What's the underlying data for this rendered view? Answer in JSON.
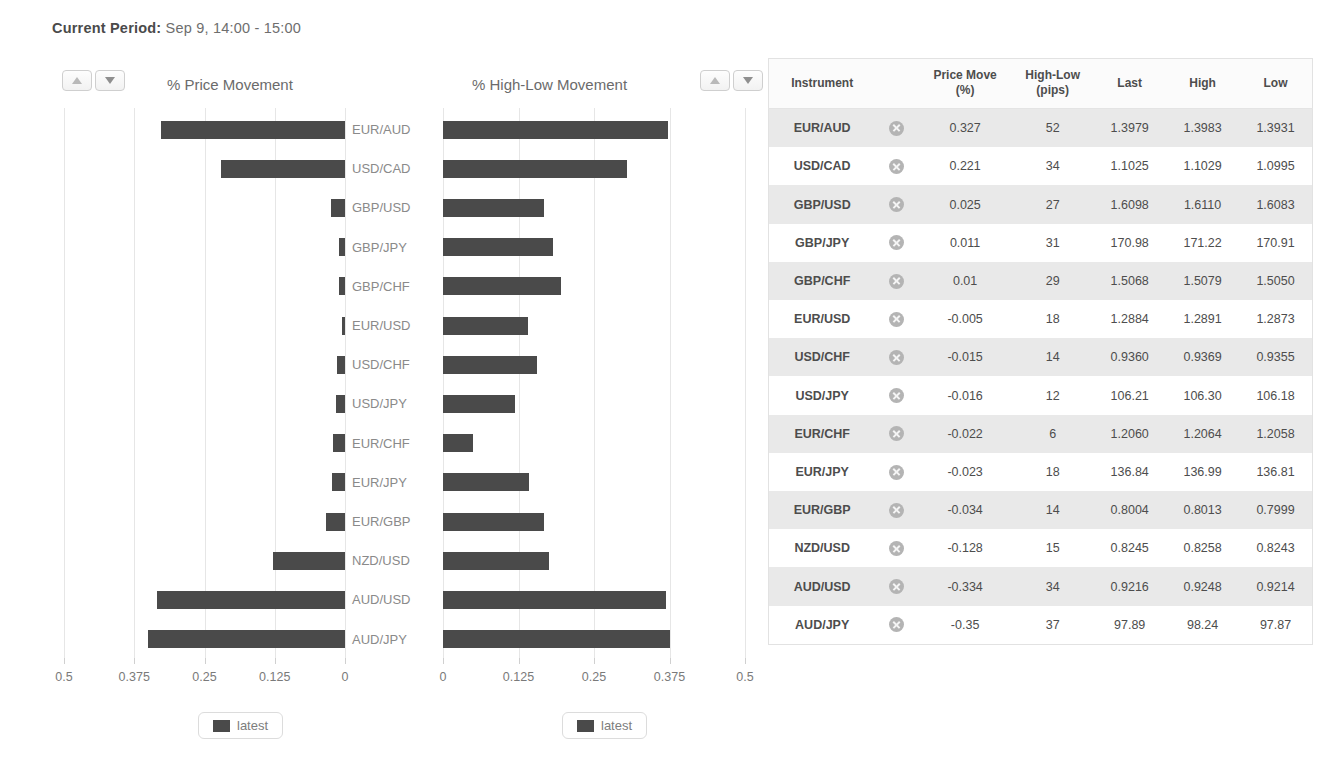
{
  "header": {
    "label": "Current Period:",
    "value": "Sep 9, 14:00 - 15:00"
  },
  "sort_controls": {
    "ascending_label": "▲",
    "descending_label": "▼"
  },
  "charts": {
    "left_title": "% Price Movement",
    "right_title": "% High-Low Movement",
    "legend_label": "latest",
    "bar_color": "#4a4a4a",
    "grid_color": "#e6e6e6"
  },
  "chart_data": [
    {
      "type": "bar",
      "orientation": "horizontal",
      "direction": "reversed",
      "title": "% Price Movement",
      "xlabel": "",
      "ylabel": "",
      "xlim": [
        0,
        0.5
      ],
      "ticks": [
        "0.5",
        "0.375",
        "0.25",
        "0.125",
        "0"
      ],
      "tick_values": [
        0.5,
        0.375,
        0.25,
        0.125,
        0
      ],
      "grid": true,
      "legend": [
        "latest"
      ],
      "legend_position": "bottom",
      "categories": [
        "EUR/AUD",
        "USD/CAD",
        "GBP/USD",
        "GBP/JPY",
        "GBP/CHF",
        "EUR/USD",
        "USD/CHF",
        "USD/JPY",
        "EUR/CHF",
        "EUR/JPY",
        "EUR/GBP",
        "NZD/USD",
        "AUD/USD",
        "AUD/JPY"
      ],
      "values": [
        0.327,
        0.221,
        0.025,
        0.011,
        0.01,
        0.005,
        0.015,
        0.016,
        0.022,
        0.023,
        0.034,
        0.128,
        0.334,
        0.35
      ]
    },
    {
      "type": "bar",
      "orientation": "horizontal",
      "direction": "normal",
      "title": "% High-Low Movement",
      "xlabel": "",
      "ylabel": "",
      "xlim": [
        0,
        0.5
      ],
      "ticks": [
        "0",
        "0.125",
        "0.25",
        "0.375",
        "0.5"
      ],
      "tick_values": [
        0,
        0.125,
        0.25,
        0.375,
        0.5
      ],
      "grid": true,
      "legend": [
        "latest"
      ],
      "legend_position": "bottom",
      "categories": [
        "EUR/AUD",
        "USD/CAD",
        "GBP/USD",
        "GBP/JPY",
        "GBP/CHF",
        "EUR/USD",
        "USD/CHF",
        "USD/JPY",
        "EUR/CHF",
        "EUR/JPY",
        "EUR/GBP",
        "NZD/USD",
        "AUD/USD",
        "AUD/JPY"
      ],
      "values": [
        0.372,
        0.305,
        0.168,
        0.182,
        0.195,
        0.14,
        0.155,
        0.12,
        0.05,
        0.143,
        0.168,
        0.176,
        0.369,
        0.375
      ]
    }
  ],
  "table": {
    "columns": [
      "Instrument",
      "",
      "Price Move\n(%)",
      "High-Low\n(pips)",
      "Last",
      "High",
      "Low"
    ],
    "headers": {
      "instrument": "Instrument",
      "price_move": "Price Move",
      "price_move_unit": "(%)",
      "high_low": "High-Low",
      "high_low_unit": "(pips)",
      "last": "Last",
      "high": "High",
      "low": "Low"
    },
    "remove_icon": "remove-circle-icon",
    "rows": [
      {
        "instrument": "EUR/AUD",
        "price_move": "0.327",
        "high_low": "52",
        "last": "1.3979",
        "high": "1.3983",
        "low": "1.3931"
      },
      {
        "instrument": "USD/CAD",
        "price_move": "0.221",
        "high_low": "34",
        "last": "1.1025",
        "high": "1.1029",
        "low": "1.0995"
      },
      {
        "instrument": "GBP/USD",
        "price_move": "0.025",
        "high_low": "27",
        "last": "1.6098",
        "high": "1.6110",
        "low": "1.6083"
      },
      {
        "instrument": "GBP/JPY",
        "price_move": "0.011",
        "high_low": "31",
        "last": "170.98",
        "high": "171.22",
        "low": "170.91"
      },
      {
        "instrument": "GBP/CHF",
        "price_move": "0.01",
        "high_low": "29",
        "last": "1.5068",
        "high": "1.5079",
        "low": "1.5050"
      },
      {
        "instrument": "EUR/USD",
        "price_move": "-0.005",
        "high_low": "18",
        "last": "1.2884",
        "high": "1.2891",
        "low": "1.2873"
      },
      {
        "instrument": "USD/CHF",
        "price_move": "-0.015",
        "high_low": "14",
        "last": "0.9360",
        "high": "0.9369",
        "low": "0.9355"
      },
      {
        "instrument": "USD/JPY",
        "price_move": "-0.016",
        "high_low": "12",
        "last": "106.21",
        "high": "106.30",
        "low": "106.18"
      },
      {
        "instrument": "EUR/CHF",
        "price_move": "-0.022",
        "high_low": "6",
        "last": "1.2060",
        "high": "1.2064",
        "low": "1.2058"
      },
      {
        "instrument": "EUR/JPY",
        "price_move": "-0.023",
        "high_low": "18",
        "last": "136.84",
        "high": "136.99",
        "low": "136.81"
      },
      {
        "instrument": "EUR/GBP",
        "price_move": "-0.034",
        "high_low": "14",
        "last": "0.8004",
        "high": "0.8013",
        "low": "0.7999"
      },
      {
        "instrument": "NZD/USD",
        "price_move": "-0.128",
        "high_low": "15",
        "last": "0.8245",
        "high": "0.8258",
        "low": "0.8243"
      },
      {
        "instrument": "AUD/USD",
        "price_move": "-0.334",
        "high_low": "34",
        "last": "0.9216",
        "high": "0.9248",
        "low": "0.9214"
      },
      {
        "instrument": "AUD/JPY",
        "price_move": "-0.35",
        "high_low": "37",
        "last": "97.89",
        "high": "98.24",
        "low": "97.87"
      }
    ]
  }
}
